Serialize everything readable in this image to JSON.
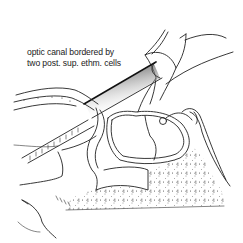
{
  "figure": {
    "type": "anatomical line illustration",
    "background": "#ffffff",
    "ink": "#222222"
  },
  "annotation": {
    "line1": "optic canal bordered by",
    "line2": "two post. sup. ethm. cells"
  },
  "structures": [
    {
      "name": "optic-canal-probe",
      "description": "shaded cylindrical probe passing diagonally through optic canal"
    },
    {
      "name": "lower-probe",
      "description": "second diagonal hatched probe below"
    },
    {
      "name": "sphenoid-sinus",
      "description": "rounded cavity with double-line wall"
    },
    {
      "name": "cancellous-bone",
      "description": "dotted/stippled bone region below sinus"
    },
    {
      "name": "anterior-clinoid",
      "description": "curved structures top right"
    }
  ]
}
